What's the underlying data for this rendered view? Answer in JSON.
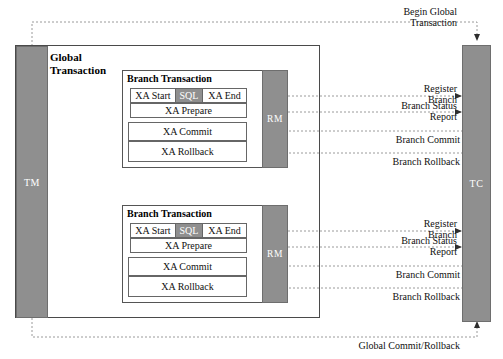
{
  "diagram": {
    "colors": {
      "actor_fill": "#8f8f8f",
      "actor_stroke": "#6e6e6e",
      "box_stroke": "#4a4a4a",
      "line": "#8a8a8a",
      "text": "#111111",
      "sql_fill": "#8f8f8f"
    }
  },
  "actors": {
    "tm": {
      "label": "TM"
    },
    "tc": {
      "label": "TC"
    },
    "rm_1": {
      "label": "RM"
    },
    "rm_2": {
      "label": "RM"
    }
  },
  "global_transaction": {
    "title_line1": "Global",
    "title_line2": "Transaction"
  },
  "branches": [
    {
      "title": "Branch Transaction",
      "ops": {
        "xa_start": "XA Start",
        "sql": "SQL",
        "xa_end": "XA End",
        "xa_prepare": "XA Prepare",
        "xa_commit": "XA Commit",
        "xa_rollback": "XA Rollback"
      },
      "messages": {
        "register_l1": "Register",
        "register_l2": "Branch",
        "status_l1": "Branch Status",
        "status_l2": "Report",
        "branch_commit": "Branch Commit",
        "branch_rollback": "Branch Rollback"
      }
    },
    {
      "title": "Branch Transaction",
      "ops": {
        "xa_start": "XA Start",
        "sql": "SQL",
        "xa_end": "XA End",
        "xa_prepare": "XA Prepare",
        "xa_commit": "XA Commit",
        "xa_rollback": "XA Rollback"
      },
      "messages": {
        "register_l1": "Register",
        "register_l2": "Branch",
        "status_l1": "Branch Status",
        "status_l2": "Report",
        "branch_commit": "Branch Commit",
        "branch_rollback": "Branch Rollback"
      }
    }
  ],
  "global_messages": {
    "begin_l1": "Begin Global",
    "begin_l2": "Transaction",
    "commit_rollback": "Global Commit/Rollback"
  }
}
